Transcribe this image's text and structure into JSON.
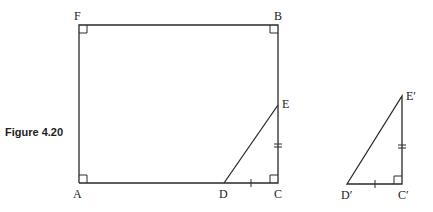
{
  "caption": "Figure 4.20",
  "figure1": {
    "labels": {
      "F": "F",
      "B": "B",
      "E": "E",
      "A": "A",
      "D": "D",
      "C": "C"
    },
    "points": {
      "F": [
        79,
        25
      ],
      "B": [
        278,
        25
      ],
      "C": [
        278,
        183
      ],
      "A": [
        79,
        183
      ],
      "E": [
        278,
        105
      ],
      "D": [
        224,
        183
      ]
    },
    "right_angles": [
      "F",
      "B",
      "A",
      "C"
    ],
    "tick_marks": {
      "DC": 1,
      "EC": 2
    }
  },
  "figure2": {
    "labels": {
      "E": "E′",
      "D": "D′",
      "C": "C′"
    },
    "points": {
      "E": [
        402,
        96
      ],
      "D": [
        347,
        184
      ],
      "C": [
        402,
        184
      ]
    },
    "right_angles": [
      "C"
    ],
    "tick_marks": {
      "DC": 1,
      "EC": 2
    }
  },
  "colors": {
    "stroke": "#2a2a2a",
    "text": "#222222",
    "background": "#ffffff"
  }
}
